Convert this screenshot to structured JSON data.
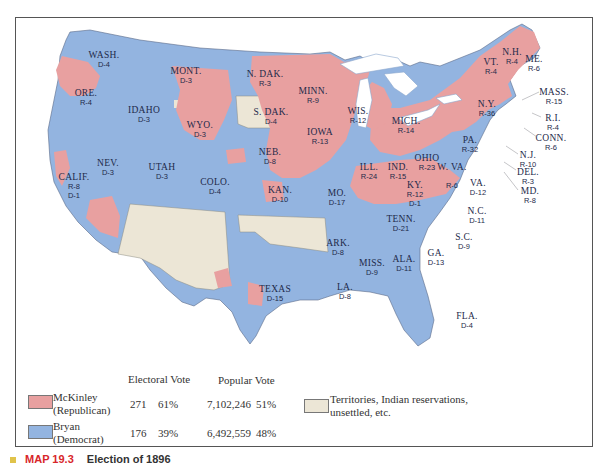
{
  "colors": {
    "republican": "#e8a0a0",
    "democrat": "#93b4e0",
    "territory": "#ece6d6",
    "water": "#ffffff",
    "border": "#5a6a88"
  },
  "map": {
    "states": [
      {
        "name": "WASH.",
        "result": "D-4"
      },
      {
        "name": "ORE.",
        "result": "R-4"
      },
      {
        "name": "CALIF.",
        "result": "R-8",
        "result2": "D-1"
      },
      {
        "name": "IDAHO",
        "result": "D-3"
      },
      {
        "name": "NEV.",
        "result": "D-3"
      },
      {
        "name": "UTAH",
        "result": "D-3"
      },
      {
        "name": "MONT.",
        "result": "D-3"
      },
      {
        "name": "WYO.",
        "result": "D-3"
      },
      {
        "name": "COLO.",
        "result": "D-4"
      },
      {
        "name": "N. DAK.",
        "result": "R-3"
      },
      {
        "name": "S. DAK.",
        "result": "D-4"
      },
      {
        "name": "NEB.",
        "result": "D-8"
      },
      {
        "name": "KAN.",
        "result": "D-10"
      },
      {
        "name": "TEXAS",
        "result": "D-15"
      },
      {
        "name": "MINN.",
        "result": "R-9"
      },
      {
        "name": "IOWA",
        "result": "R-13"
      },
      {
        "name": "MO.",
        "result": "D-17"
      },
      {
        "name": "ARK.",
        "result": "D-8"
      },
      {
        "name": "LA.",
        "result": "D-8"
      },
      {
        "name": "WIS.",
        "result": "R-12"
      },
      {
        "name": "ILL.",
        "result": "R-24"
      },
      {
        "name": "MICH.",
        "result": "R-14"
      },
      {
        "name": "IND.",
        "result": "R-15"
      },
      {
        "name": "OHIO",
        "result": "R-23"
      },
      {
        "name": "KY.",
        "result": "R-12",
        "result2": "D-1"
      },
      {
        "name": "TENN.",
        "result": "D-21"
      },
      {
        "name": "MISS.",
        "result": "D-9"
      },
      {
        "name": "ALA.",
        "result": "D-11"
      },
      {
        "name": "GA.",
        "result": "D-13"
      },
      {
        "name": "FLA.",
        "result": "D-4"
      },
      {
        "name": "S.C.",
        "result": "D-9"
      },
      {
        "name": "N.C.",
        "result": "D-11"
      },
      {
        "name": "VA.",
        "result": "D-12"
      },
      {
        "name": "W. VA.",
        "result": "R-6"
      },
      {
        "name": "PA.",
        "result": "R-32"
      },
      {
        "name": "N.Y.",
        "result": "R-36"
      },
      {
        "name": "VT.",
        "result": "R-4"
      },
      {
        "name": "N.H.",
        "result": "R-4"
      },
      {
        "name": "ME.",
        "result": "R-6"
      },
      {
        "name": "MASS.",
        "result": "R-15"
      },
      {
        "name": "R.I.",
        "result": "R-4"
      },
      {
        "name": "CONN.",
        "result": "R-6"
      },
      {
        "name": "N.J.",
        "result": "R-10"
      },
      {
        "name": "DEL.",
        "result": "R-3"
      },
      {
        "name": "MD.",
        "result": "R-8"
      }
    ]
  },
  "legend": {
    "headers": {
      "electoral": "Electoral Vote",
      "popular": "Popular Vote"
    },
    "candidates": [
      {
        "name": "McKinley",
        "party": "(Republican)",
        "electoral_votes": "271",
        "electoral_pct": "61%",
        "popular_votes": "7,102,246",
        "popular_pct": "51%"
      },
      {
        "name": "Bryan",
        "party": "(Democrat)",
        "electoral_votes": "176",
        "electoral_pct": "39%",
        "popular_votes": "6,492,559",
        "popular_pct": "48%"
      }
    ],
    "territory_label_line1": "Territories, Indian reservations,",
    "territory_label_line2": "unsettled, etc."
  },
  "caption": {
    "number": "MAP 19.3",
    "title": "Election of 1896"
  }
}
